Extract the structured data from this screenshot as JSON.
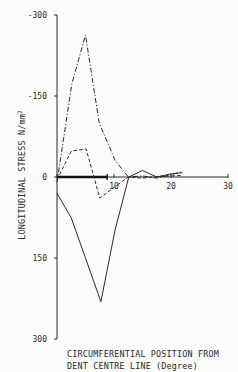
{
  "chart_data": {
    "type": "line",
    "title": "",
    "xlabel": "CIRCUMFERENTIAL POSITION FROM DENT CENTRE LINE (Degree)",
    "xlabel_lines": [
      "CIRCUMFERENTIAL POSITION FROM",
      "DENT CENTRE LINE (Degree)"
    ],
    "ylabel": "LONGITUDINAL STRESS N/mm2",
    "ylabel_text": "LONGITUDINAL STRESS  N/mm",
    "ylabel_sup": "2",
    "xlim": [
      0,
      30
    ],
    "ylim": [
      -300,
      300
    ],
    "y_inverted": true,
    "grid": false,
    "legend": null,
    "x_ticks": [
      0,
      10,
      20,
      30
    ],
    "x_tick_labels": [
      "",
      "10",
      "20",
      "30"
    ],
    "y_ticks": [
      -300,
      -150,
      0,
      150,
      300
    ],
    "y_tick_labels": [
      "-300",
      "-150",
      "0",
      "150",
      "300"
    ],
    "annotations": [
      {
        "type": "bold-bar",
        "from_deg": 0,
        "to_deg": 8.8,
        "at_stress": 0,
        "meaning": "dent extent"
      }
    ],
    "series": [
      {
        "name": "dash-dot",
        "style": "dashdot",
        "x": [
          0,
          2.6,
          5.0,
          7.4,
          10.2,
          12.5,
          15.0,
          17.5,
          20.0,
          22.0
        ],
        "values": [
          10,
          -172,
          -263,
          -100,
          -31,
          0,
          -2,
          2,
          -4,
          -10
        ]
      },
      {
        "name": "dashed",
        "style": "dashed",
        "x": [
          0,
          2.5,
          5.1,
          7.5,
          10.2,
          12.5,
          15.0,
          17.5,
          20.0,
          22.0
        ],
        "values": [
          5,
          -48,
          -52,
          39,
          18,
          0,
          2,
          -1,
          -2,
          -3
        ]
      },
      {
        "name": "solid",
        "style": "solid",
        "x": [
          0,
          2.5,
          7.7,
          10.2,
          12.6,
          15.0,
          17.5,
          20.0,
          22.0
        ],
        "values": [
          30,
          76,
          231,
          98,
          0,
          -12,
          0,
          -6,
          -8
        ]
      }
    ]
  }
}
